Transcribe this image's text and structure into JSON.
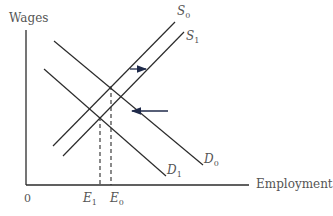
{
  "axes": {
    "y_label": "Wages",
    "x_label": "Employment",
    "origin": "0"
  },
  "curves": {
    "s0": {
      "label": "S",
      "sub": "0"
    },
    "s1": {
      "label": "S",
      "sub": "1"
    },
    "d0": {
      "label": "D",
      "sub": "0"
    },
    "d1": {
      "label": "D",
      "sub": "1"
    }
  },
  "ticks": {
    "e1": {
      "label": "E",
      "sub": "1"
    },
    "e0": {
      "label": "E",
      "sub": "0"
    }
  },
  "colors": {
    "line": "#2b2b2b",
    "text": "#555555",
    "arrow": "#1f2a4a"
  }
}
